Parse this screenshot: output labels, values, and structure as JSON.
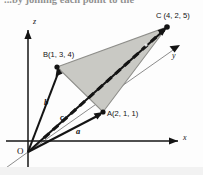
{
  "figure": {
    "caption_fragment": "...by joining each point to the",
    "axes": {
      "x_label": "x",
      "y_label": "y",
      "z_label": "z",
      "origin_label": "O"
    },
    "points": [
      {
        "id": "A",
        "label": "A(2, 1, 1)",
        "coords": [
          2,
          1,
          1
        ],
        "px": [
          103,
          112
        ]
      },
      {
        "id": "B",
        "label": "B(1, 3, 4)",
        "coords": [
          1,
          3,
          4
        ],
        "px": [
          57,
          67
        ]
      },
      {
        "id": "C",
        "label": "C (4, 2, 5)",
        "coords": [
          4,
          2,
          5
        ],
        "px": [
          167,
          27
        ]
      }
    ],
    "vectors": [
      {
        "id": "a",
        "label": "a",
        "from": "O",
        "to": "A"
      },
      {
        "id": "b",
        "label": "b",
        "from": "O",
        "to": "B"
      },
      {
        "id": "c",
        "label": "c",
        "from": "O",
        "to": "C"
      }
    ],
    "shaded_region": {
      "name": "triangle-ABC",
      "vertices": [
        "B",
        "C",
        "A"
      ],
      "fill_color": "#c9c9c4"
    },
    "dashed_line": {
      "name": "dashed-diagonal",
      "from": "O",
      "to": "C",
      "style": "bold-dashed"
    },
    "colors": {
      "ink": "#141414",
      "shade": "#c9c9c4",
      "shade_edge": "#8e8e8a",
      "background": "#fdfdfd",
      "band": "#f2f2f2"
    }
  }
}
